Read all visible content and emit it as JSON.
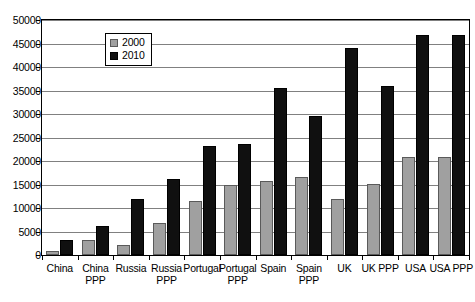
{
  "chart_data": {
    "type": "bar",
    "title": "",
    "xlabel": "",
    "ylabel": "",
    "ylim": [
      0,
      50000
    ],
    "ytick_step": 5000,
    "yticks": [
      "0",
      "5000",
      "10000",
      "15000",
      "20000",
      "25000",
      "30000",
      "35000",
      "40000",
      "45000",
      "50000"
    ],
    "grid": true,
    "legend_position": "upper-left-inside",
    "categories": [
      "China",
      "China PPP",
      "Russia",
      "Russia PPP",
      "Portugal",
      "Portugal PPP",
      "Spain",
      "Spain PPP",
      "UK",
      "UK PPP",
      "USA",
      "USA PPP"
    ],
    "category_lines": [
      [
        "China"
      ],
      [
        "China",
        "PPP"
      ],
      [
        "Russia"
      ],
      [
        "Russia",
        "PPP"
      ],
      [
        "Portugal"
      ],
      [
        "Portugal",
        "PPP"
      ],
      [
        "Spain"
      ],
      [
        "Spain",
        "PPP"
      ],
      [
        "UK"
      ],
      [
        "UK PPP"
      ],
      [
        "USA"
      ],
      [
        "USA PPP"
      ]
    ],
    "series": [
      {
        "name": "2000",
        "color": "#a0a0a0",
        "values": [
          800,
          3200,
          2200,
          6800,
          11500,
          15000,
          15800,
          16500,
          12000,
          15200,
          20800,
          20800
        ]
      },
      {
        "name": "2010",
        "color": "#101010",
        "values": [
          3300,
          6100,
          12000,
          16100,
          23200,
          23600,
          35500,
          29500,
          44000,
          36000,
          46800,
          46800
        ]
      }
    ]
  },
  "legend": {
    "items": [
      {
        "label": "2000"
      },
      {
        "label": "2010"
      }
    ]
  }
}
